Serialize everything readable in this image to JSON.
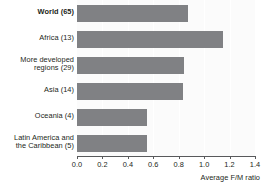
{
  "chart_data": {
    "type": "bar",
    "orientation": "horizontal",
    "title": "",
    "xlabel": "Average F/M ratio",
    "ylabel": "",
    "xlim": [
      0.0,
      1.4
    ],
    "xticks": [
      "0.0",
      "0.2",
      "0.4",
      "0.6",
      "0.8",
      "1.0",
      "1.2",
      "1.4"
    ],
    "xtick_values": [
      0.0,
      0.2,
      0.4,
      0.6,
      0.8,
      1.0,
      1.2,
      1.4
    ],
    "grid": "vertical",
    "legend": "none",
    "bar_color": "#808184",
    "plot_background": "#fbfbfb",
    "categories": [
      "World (65)",
      "Africa (13)",
      "More developed regions (29)",
      "Asia (14)",
      "Oceania (4)",
      "Latin America and the Caribbean (5)"
    ],
    "values": [
      0.87,
      1.15,
      0.84,
      0.83,
      0.55,
      0.55
    ]
  },
  "labels": [
    {
      "lines": [
        "World (65)"
      ],
      "bold": true
    },
    {
      "lines": [
        "Africa (13)"
      ],
      "bold": false
    },
    {
      "lines": [
        "More developed",
        "regions (29)"
      ],
      "bold": false
    },
    {
      "lines": [
        "Asia (14)"
      ],
      "bold": false
    },
    {
      "lines": [
        "Oceania (4)"
      ],
      "bold": false
    },
    {
      "lines": [
        "Latin America and",
        "the Caribbean (5)"
      ],
      "bold": false
    }
  ]
}
